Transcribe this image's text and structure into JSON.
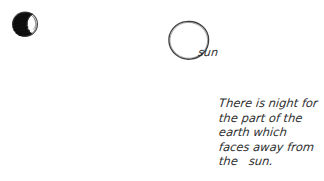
{
  "canvas": {
    "width": 324,
    "height": 181,
    "background_color": "#ffffff",
    "ink_color": "#2e2e2e",
    "medium": "hand-drawn pencil sketch on white paper"
  },
  "earth": {
    "label": "earth",
    "description": "small circle, left side shaded solid black (night side), right crescent left unshaded (day side facing the sun)",
    "shaded_color": "#121212",
    "outline_color": "#3a3a3a",
    "center_x": 25,
    "center_y": 24,
    "radius": 12
  },
  "sun": {
    "caption": "sun",
    "description": "large irregular hand-drawn open circle, unfilled",
    "outline_color": "#3d3d3d",
    "center_x": 188,
    "center_y": 41,
    "radius": 20
  },
  "explanation": {
    "full_text": "There is night for the part of the earth which faces away from the sun.",
    "lines": [
      "There is night for",
      "the part of the",
      "earth which",
      "faces away from",
      "the   sun."
    ]
  }
}
